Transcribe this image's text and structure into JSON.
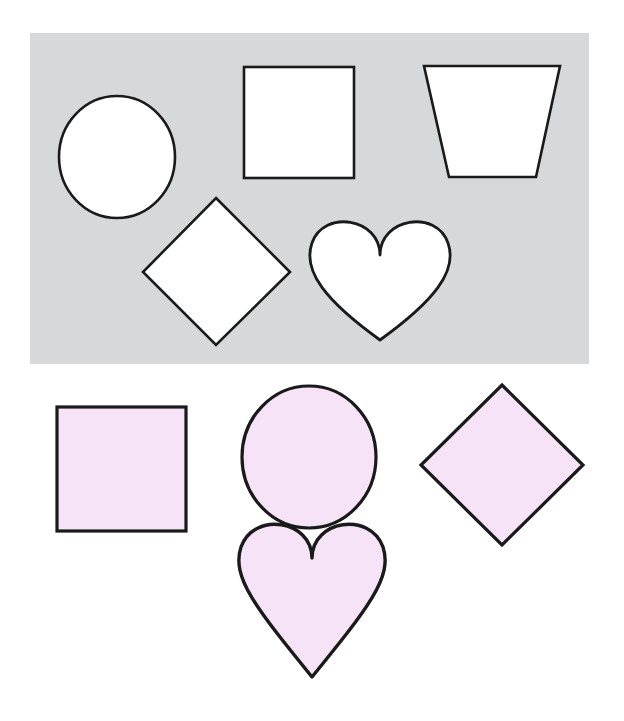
{
  "page": {
    "background_color": "#ffffff",
    "width": 624,
    "height": 721
  },
  "shape_panel": {
    "background_color": "#d6d8d9",
    "stroke_color": "#1a1a1a",
    "fill_color": "#ffffff",
    "shapes": [
      {
        "name": "circle",
        "label": "circle"
      },
      {
        "name": "square",
        "label": "square"
      },
      {
        "name": "trapezoid",
        "label": "trapezoid"
      },
      {
        "name": "diamond",
        "label": "diamond"
      },
      {
        "name": "heart",
        "label": "heart"
      }
    ]
  },
  "word_shapes": {
    "fill_color": "#f7e3f7",
    "stroke_color": "#1a1a1a",
    "text_color": "#19161c",
    "items": [
      {
        "shape": "square",
        "word": "lo"
      },
      {
        "shape": "circle",
        "word": "todo"
      },
      {
        "shape": "diamond",
        "word": "que"
      },
      {
        "shape": "heart",
        "word": "corazón"
      }
    ]
  }
}
